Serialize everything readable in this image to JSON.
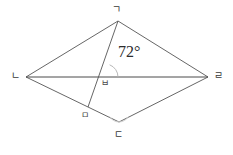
{
  "figure": {
    "type": "geometry-diagram",
    "shape": "rhombus-with-cevian",
    "background_color": "#ffffff",
    "line_color": "#555555",
    "arc_color": "#b4b4b4",
    "text_color": "#333333"
  },
  "vertices": {
    "top": {
      "label": "ㄱ",
      "x": 118,
      "y": 21,
      "label_x": 113,
      "label_y": 6
    },
    "left": {
      "label": "ㄴ",
      "x": 26,
      "y": 77,
      "label_x": 12,
      "label_y": 72
    },
    "bottom": {
      "label": "ㄷ",
      "x": 119,
      "y": 122,
      "label_x": 114,
      "label_y": 131
    },
    "right": {
      "label": "ㄹ",
      "x": 208,
      "y": 77,
      "label_x": 214,
      "label_y": 72
    }
  },
  "points": {
    "foot": {
      "label": "ㅁ",
      "x": 88,
      "y": 107,
      "label_x": 82,
      "label_y": 112
    },
    "intersection": {
      "label": "ㅂ",
      "x": 105,
      "y": 77,
      "label_x": 101,
      "label_y": 80
    }
  },
  "angle": {
    "value": "72°",
    "label_x": 118,
    "label_y": 51,
    "arc_center_x": 105,
    "arc_center_y": 77,
    "arc_radius": 13
  },
  "segments": [
    {
      "name": "side-top-left",
      "from": "top",
      "to": "left"
    },
    {
      "name": "side-top-right",
      "from": "top",
      "to": "right"
    },
    {
      "name": "side-bottom-left",
      "from": "left",
      "to": "bottom"
    },
    {
      "name": "side-bottom-right",
      "from": "bottom",
      "to": "right"
    },
    {
      "name": "diagonal-horizontal",
      "from": "left",
      "to": "right"
    },
    {
      "name": "cevian-top-to-foot",
      "from": "top",
      "to": "foot"
    }
  ],
  "marks": {
    "bottom_angle_arc": {
      "cx": 119,
      "cy": 122,
      "r": 11
    }
  }
}
